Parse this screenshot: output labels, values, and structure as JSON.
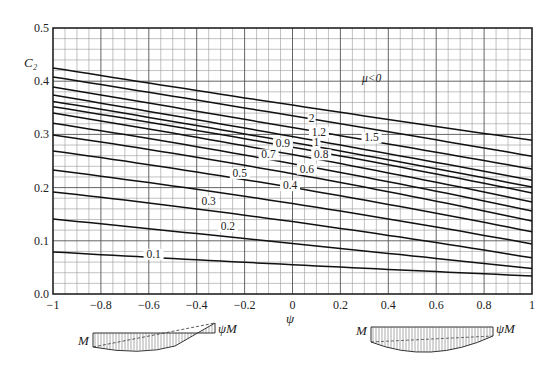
{
  "chart_data": {
    "type": "line",
    "title": "",
    "xlabel": "ψ",
    "ylabel": "C₂",
    "xlim": [
      -1,
      1
    ],
    "ylim": [
      0,
      0.5
    ],
    "grid": true,
    "x_ticks": [
      "-1",
      "-0.8",
      "-0.6",
      "-0.4",
      "-0.2",
      "0",
      "0.2",
      "0.4",
      "0.6",
      "0.8",
      "1"
    ],
    "y_ticks": [
      "0.0",
      "0.1",
      "0.2",
      "0.3",
      "0.4",
      "0.5"
    ],
    "x": [
      -1,
      0,
      1
    ],
    "series_param": "μ",
    "series": [
      {
        "name": "μ<0",
        "values": [
          0.425,
          0.355,
          0.289
        ],
        "label_pos": [
          0.15,
          0.38
        ]
      },
      {
        "name": "2",
        "values": [
          0.408,
          0.335,
          0.259
        ],
        "label_pos": [
          0.08,
          0.324
        ]
      },
      {
        "name": "1.5",
        "values": [
          0.389,
          0.313,
          0.235
        ],
        "label_pos": [
          0.33,
          0.287
        ]
      },
      {
        "name": "1.2",
        "values": [
          0.374,
          0.296,
          0.214
        ],
        "label_pos": [
          0.11,
          0.297
        ]
      },
      {
        "name": "1",
        "values": [
          0.362,
          0.285,
          0.201
        ],
        "label_pos": [
          0.1,
          0.278
        ]
      },
      {
        "name": "0.9",
        "values": [
          0.352,
          0.276,
          0.19
        ],
        "label_pos": [
          -0.04,
          0.276
        ]
      },
      {
        "name": "0.8",
        "values": [
          0.34,
          0.262,
          0.173
        ],
        "label_pos": [
          0.12,
          0.255
        ]
      },
      {
        "name": "0.7",
        "values": [
          0.321,
          0.245,
          0.156
        ],
        "label_pos": [
          -0.1,
          0.255
        ]
      },
      {
        "name": "0.6",
        "values": [
          0.299,
          0.226,
          0.137
        ],
        "label_pos": [
          0.06,
          0.228
        ]
      },
      {
        "name": "0.5",
        "values": [
          0.269,
          0.2,
          0.117
        ],
        "label_pos": [
          -0.22,
          0.22
        ]
      },
      {
        "name": "0.4",
        "values": [
          0.233,
          0.17,
          0.094
        ],
        "label_pos": [
          -0.01,
          0.197
        ]
      },
      {
        "name": "0.3",
        "values": [
          0.192,
          0.136,
          0.068
        ],
        "label_pos": [
          -0.35,
          0.167
        ]
      },
      {
        "name": "0.2",
        "values": [
          0.141,
          0.095,
          0.048
        ],
        "label_pos": [
          -0.27,
          0.12
        ]
      },
      {
        "name": "0.1",
        "values": [
          0.079,
          0.055,
          0.034
        ],
        "label_pos": [
          -0.58,
          0.068
        ]
      }
    ],
    "annotations": [
      {
        "text": "μ<0",
        "x": 0.29,
        "y": 0.398
      }
    ],
    "diagrams": [
      {
        "name": "moment-diagram-reverse-curvature",
        "left_label": "M",
        "right_label": "ψM"
      },
      {
        "name": "moment-diagram-single-curvature",
        "left_label": "M",
        "right_label": "ψM"
      }
    ]
  }
}
